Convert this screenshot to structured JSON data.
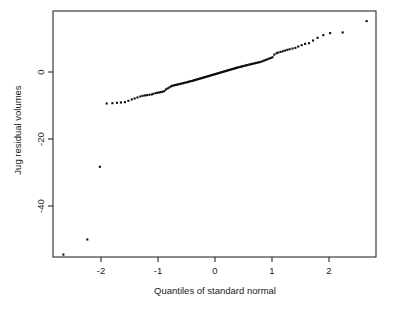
{
  "figure": {
    "background_color": "#ffffff",
    "frame_color": "#2b2b2b",
    "point_color": "#0d0d0d"
  },
  "chart_data": {
    "type": "scatter",
    "title": "",
    "subtitle": "",
    "xlabel": "Quantiles of standard normal",
    "ylabel": "Jug residual volumes",
    "xlim": [
      -2.85,
      2.85
    ],
    "ylim": [
      -58.0,
      17.5
    ],
    "xticks": [
      -2,
      -1,
      0,
      1,
      2
    ],
    "xticklabels": [
      "-2",
      "-1",
      "0",
      "1",
      "2"
    ],
    "yticks": [
      0,
      -20,
      -40
    ],
    "yticklabels": [
      "0",
      "-20",
      "-40"
    ],
    "grid": false,
    "legend": null,
    "marker": "filled-square",
    "marker_size": 2.1,
    "series": [
      {
        "name": "Jug residual volumes",
        "x": [
          -2.66,
          -2.24,
          -2.02,
          -1.9,
          -1.8,
          -1.72,
          -1.65,
          -1.58,
          -1.52,
          -1.46,
          -1.41,
          -1.36,
          -1.31,
          -1.27,
          -1.23,
          -1.19,
          -1.15,
          -1.11,
          -1.08,
          -1.04,
          -1.01,
          -0.98,
          -0.95,
          -0.92,
          -0.89,
          -0.86,
          -0.83,
          -0.8,
          -0.77,
          -0.75,
          -0.72,
          -0.7,
          -0.67,
          -0.65,
          -0.62,
          -0.6,
          -0.57,
          -0.55,
          -0.53,
          -0.5,
          -0.48,
          -0.46,
          -0.44,
          -0.41,
          -0.39,
          -0.37,
          -0.35,
          -0.33,
          -0.31,
          -0.29,
          -0.27,
          -0.25,
          -0.23,
          -0.21,
          -0.19,
          -0.17,
          -0.15,
          -0.13,
          -0.11,
          -0.09,
          -0.07,
          -0.05,
          -0.03,
          -0.01,
          0.01,
          0.03,
          0.05,
          0.07,
          0.09,
          0.11,
          0.13,
          0.15,
          0.17,
          0.19,
          0.21,
          0.23,
          0.25,
          0.27,
          0.29,
          0.31,
          0.33,
          0.35,
          0.37,
          0.39,
          0.41,
          0.44,
          0.46,
          0.48,
          0.5,
          0.53,
          0.55,
          0.57,
          0.6,
          0.62,
          0.65,
          0.67,
          0.7,
          0.72,
          0.75,
          0.77,
          0.8,
          0.83,
          0.86,
          0.89,
          0.92,
          0.95,
          0.98,
          1.01,
          1.04,
          1.08,
          1.11,
          1.15,
          1.19,
          1.23,
          1.27,
          1.31,
          1.36,
          1.41,
          1.46,
          1.52,
          1.58,
          1.65,
          1.72,
          1.8,
          1.9,
          2.02,
          2.24,
          2.66
        ],
        "y": [
          -54.5,
          -50.0,
          -28.3,
          -9.4,
          -9.3,
          -9.2,
          -9.1,
          -9.0,
          -8.6,
          -8.2,
          -7.9,
          -7.6,
          -7.3,
          -7.1,
          -7.0,
          -6.9,
          -6.8,
          -6.7,
          -6.5,
          -6.3,
          -6.2,
          -6.1,
          -6.0,
          -5.9,
          -5.7,
          -5.2,
          -4.9,
          -4.6,
          -4.3,
          -4.1,
          -4.0,
          -3.9,
          -3.8,
          -3.7,
          -3.6,
          -3.5,
          -3.4,
          -3.3,
          -3.2,
          -3.1,
          -3.0,
          -2.9,
          -2.8,
          -2.7,
          -2.6,
          -2.5,
          -2.4,
          -2.3,
          -2.2,
          -2.1,
          -2.0,
          -1.9,
          -1.8,
          -1.7,
          -1.6,
          -1.5,
          -1.4,
          -1.3,
          -1.2,
          -1.1,
          -1.0,
          -0.9,
          -0.8,
          -0.7,
          -0.6,
          -0.5,
          -0.4,
          -0.3,
          -0.2,
          -0.1,
          0.0,
          0.1,
          0.2,
          0.3,
          0.4,
          0.5,
          0.6,
          0.7,
          0.8,
          0.9,
          1.0,
          1.1,
          1.2,
          1.3,
          1.4,
          1.5,
          1.6,
          1.7,
          1.8,
          1.9,
          2.0,
          2.1,
          2.2,
          2.3,
          2.4,
          2.5,
          2.6,
          2.7,
          2.8,
          2.9,
          3.0,
          3.2,
          3.4,
          3.6,
          3.8,
          4.0,
          4.2,
          4.4,
          5.2,
          5.6,
          5.8,
          6.0,
          6.2,
          6.4,
          6.6,
          6.8,
          7.0,
          7.2,
          7.6,
          8.0,
          8.4,
          8.6,
          9.4,
          10.2,
          11.0,
          11.6,
          11.8,
          15.2
        ]
      }
    ]
  },
  "axes": {
    "x_tick_positions_px": [
      101,
      158,
      215,
      272,
      329
    ],
    "y_tick_positions_px": [
      72,
      139,
      206
    ],
    "plot_box_px": {
      "left": 53,
      "top": 11,
      "right": 376,
      "bottom": 257
    }
  }
}
